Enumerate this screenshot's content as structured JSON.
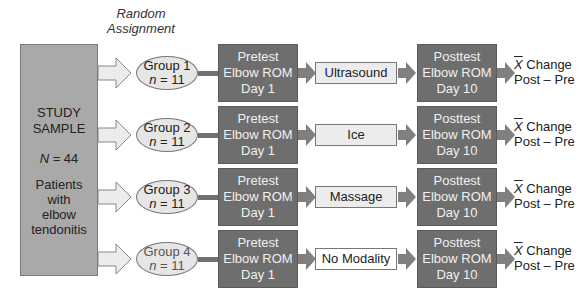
{
  "diagram": {
    "random_assignment_label": [
      "Random",
      "Assignment"
    ],
    "study_sample": {
      "title_line1": "STUDY",
      "title_line2": "SAMPLE",
      "n_symbol": "N",
      "n_value": " = 44",
      "description": [
        "Patients",
        "with",
        "elbow",
        "tendonitis"
      ]
    },
    "groups": [
      {
        "label": "Group 1",
        "n_symbol": "n",
        "n_value": " = 11",
        "pretest": [
          "Pretest",
          "Elbow ROM",
          "Day 1"
        ],
        "modality": "Ultrasound",
        "posttest": [
          "Posttest",
          "Elbow ROM",
          "Day 10"
        ],
        "result_symbol": "X",
        "result": [
          "Change",
          "Post – Pre"
        ]
      },
      {
        "label": "Group 2",
        "n_symbol": "n",
        "n_value": " = 11",
        "pretest": [
          "Pretest",
          "Elbow ROM",
          "Day 1"
        ],
        "modality": "Ice",
        "posttest": [
          "Posttest",
          "Elbow ROM",
          "Day 10"
        ],
        "result_symbol": "X",
        "result": [
          "Change",
          "Post – Pre"
        ]
      },
      {
        "label": "Group 3",
        "n_symbol": "n",
        "n_value": " = 11",
        "pretest": [
          "Pretest",
          "Elbow ROM",
          "Day 1"
        ],
        "modality": "Massage",
        "posttest": [
          "Posttest",
          "Elbow ROM",
          "Day 10"
        ],
        "result_symbol": "X",
        "result": [
          "Change",
          "Post – Pre"
        ]
      },
      {
        "label": "Group 4",
        "n_symbol": "n",
        "n_value": " = 11",
        "pretest": [
          "Pretest",
          "Elbow ROM",
          "Day 1"
        ],
        "modality": "No Modality",
        "posttest": [
          "Posttest",
          "Elbow ROM",
          "Day 10"
        ],
        "result_symbol": "X",
        "result": [
          "Change",
          "Post – Pre"
        ]
      }
    ],
    "colors": {
      "sample_fill": "#a9a9a9",
      "ellipse_fill": "#e6e6e6",
      "dark_box_fill": "#6e6e6e",
      "modality_fill": "#ececec",
      "arrow_fill": "#808080"
    }
  }
}
